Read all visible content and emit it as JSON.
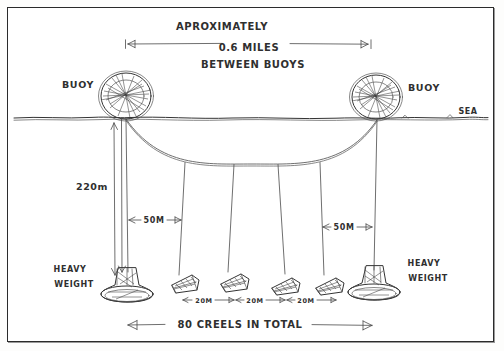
{
  "diagram": {
    "title_lines": [
      "APROXIMATELY",
      "0.6 MILES",
      "BETWEEN BUOYS"
    ],
    "span_label_line1": "APROXIMATELY",
    "span_label_line2": "0.6 MILES",
    "span_label_line3": "BETWEEN BUOYS",
    "buoy_left_label": "BUOY",
    "buoy_right_label": "BUOY",
    "sea_label": "SEA",
    "depth_label": "220m",
    "spacing_left_label": "50M",
    "spacing_right_label": "50M",
    "creel_gap_labels": [
      "20M",
      "20M",
      "20M"
    ],
    "weight_left_label_line1": "HEAVY",
    "weight_left_label_line2": "WEIGHT",
    "weight_right_label_line1": "HEAVY",
    "weight_right_label_line2": "WEIGHT",
    "total_label": "80 CREELS IN TOTAL",
    "ink_color": "#343434",
    "paper_color": "#ffffff"
  }
}
